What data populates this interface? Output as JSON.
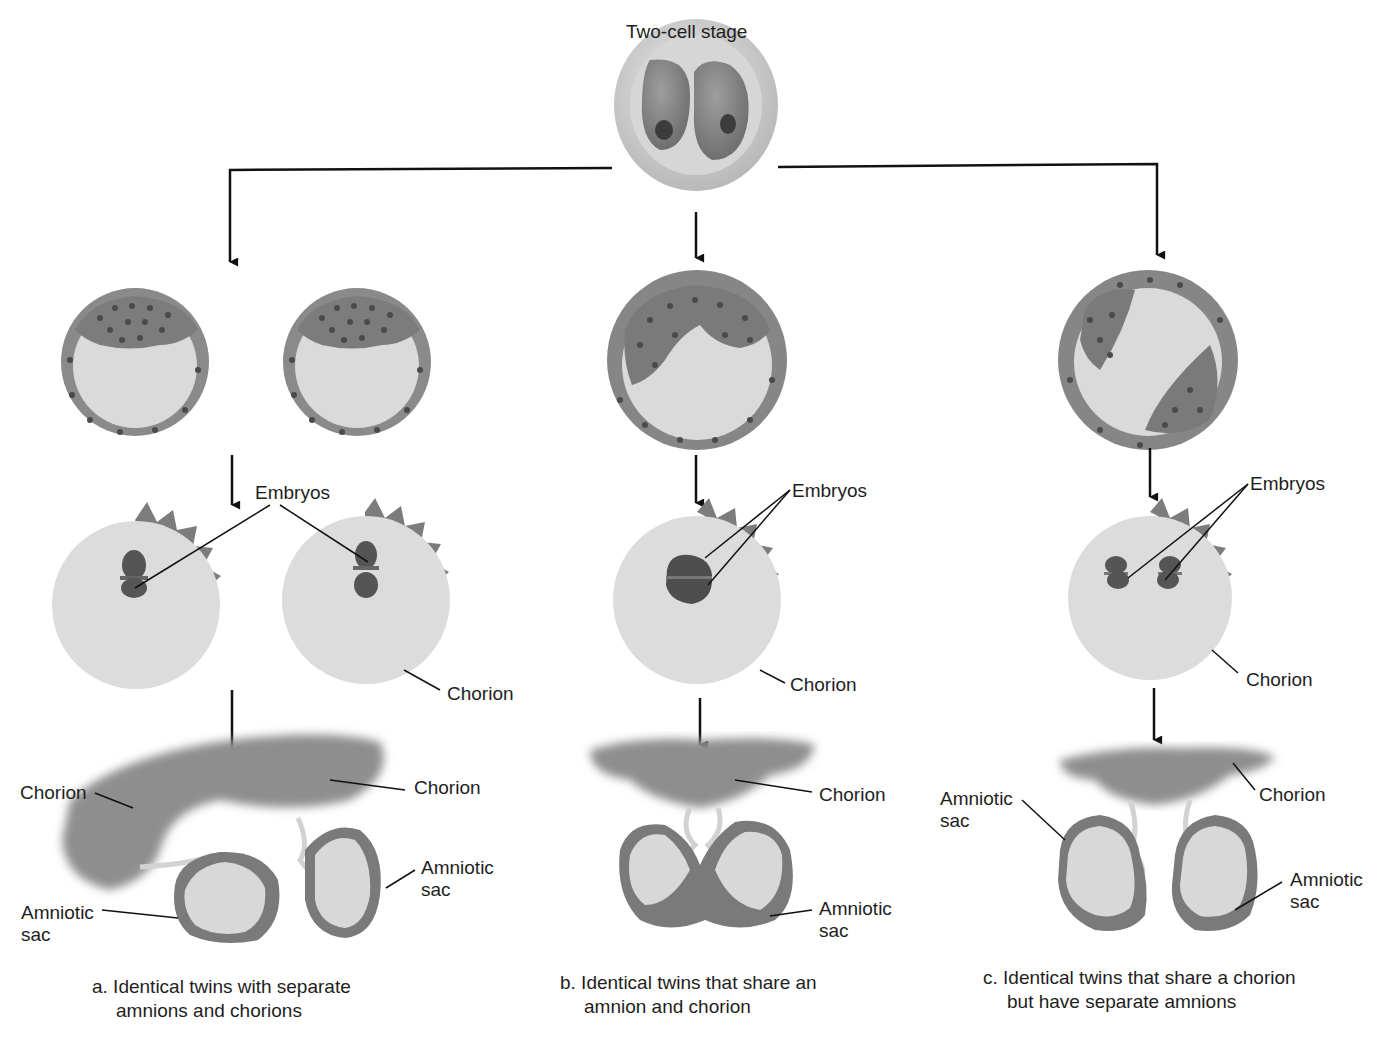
{
  "title": "Two-cell stage",
  "labels": {
    "embryos": "Embryos",
    "chorion": "Chorion",
    "amniotic_sac_line1": "Amniotic",
    "amniotic_sac_line2": "sac"
  },
  "panels": [
    {
      "id": "a",
      "caption_line1": "a. Identical twins with separate",
      "caption_line2": "amnions and chorions",
      "stage_labels": [
        "Embryos",
        "Chorion",
        "Chorion",
        "Chorion",
        "Amniotic sac",
        "Amniotic sac"
      ]
    },
    {
      "id": "b",
      "caption_line1": "b. Identical twins that share an",
      "caption_line2": "amnion and chorion",
      "stage_labels": [
        "Embryos",
        "Chorion",
        "Chorion",
        "Amniotic sac"
      ]
    },
    {
      "id": "c",
      "caption_line1": "c. Identical twins that share a chorion",
      "caption_line2": "but have separate amnions",
      "stage_labels": [
        "Embryos",
        "Chorion",
        "Amniotic sac",
        "Chorion",
        "Amniotic sac"
      ]
    }
  ],
  "colors": {
    "outline": "#111111",
    "tissue_dark": "#6e6e6e",
    "tissue_mid": "#8a8a8a",
    "cavity": "#d9d9d9",
    "shell": "#c8c8c8"
  }
}
